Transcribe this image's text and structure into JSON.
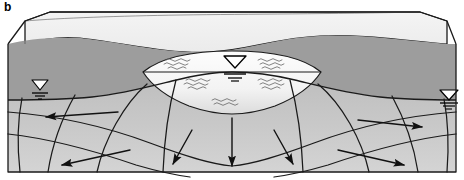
{
  "figure": {
    "panel_label": "b",
    "background_color": "#ffffff"
  },
  "colors": {
    "land_surface_top": "#f2f2f2",
    "land_surface_top_shade": "#e8e8e8",
    "unsaturated_zone": "#9b9b9b",
    "saturated_zone": "#c3c3c3",
    "saturated_zone_light": "#cfcfcf",
    "lake_water": "#fcfcfc",
    "lake_water_deep": "#e6e6e6",
    "outline": "#1a1a1a",
    "flow_line": "#1a1a1a",
    "arrow": "#111111",
    "wave_symbol": "#5a5a5a",
    "water_table_symbol_fill": "#ffffff",
    "water_table_symbol_stroke": "#000000"
  },
  "elements": {
    "block_outline_name": "3d-block-outline",
    "land_surface_name": "land-surface",
    "unsaturated_zone_name": "unsaturated-zone",
    "saturated_zone_name": "saturated-zone",
    "lake_name": "lake-water-body",
    "water_table_line_name": "water-table-line"
  },
  "water_table_symbols": [
    {
      "id": "water-table-symbol-left",
      "x": 40,
      "y": 86,
      "label": "water table (left upland)"
    },
    {
      "id": "water-table-symbol-lake",
      "x": 236,
      "y": 62,
      "label": "lake surface water table"
    },
    {
      "id": "water-table-symbol-right",
      "x": 449,
      "y": 96,
      "label": "water table (right upland)"
    }
  ],
  "flow_arrows": [
    {
      "id": "flow-arrow-left-upper",
      "direction": "left",
      "x": 37,
      "y": 117
    },
    {
      "id": "flow-arrow-left-lower",
      "direction": "left-down",
      "x": 54,
      "y": 166
    },
    {
      "id": "flow-arrow-center-left",
      "direction": "down-left",
      "x": 171,
      "y": 167
    },
    {
      "id": "flow-arrow-center",
      "direction": "down",
      "x": 232,
      "y": 170
    },
    {
      "id": "flow-arrow-center-right",
      "direction": "down-right",
      "x": 296,
      "y": 167
    },
    {
      "id": "flow-arrow-right-lower",
      "direction": "right-down",
      "x": 412,
      "y": 166
    },
    {
      "id": "flow-arrow-right-upper",
      "direction": "right",
      "x": 428,
      "y": 127
    }
  ],
  "wave_symbols": [
    {
      "id": "wave-1",
      "x": 178,
      "y": 62
    },
    {
      "id": "wave-2",
      "x": 268,
      "y": 62
    },
    {
      "id": "wave-3",
      "x": 196,
      "y": 83
    },
    {
      "id": "wave-4",
      "x": 268,
      "y": 83
    },
    {
      "id": "wave-5",
      "x": 222,
      "y": 103
    }
  ],
  "counts": {
    "equipotential_lines": 3,
    "flow_lines": 7,
    "water_table_symbols": 3,
    "flow_arrows": 7
  }
}
